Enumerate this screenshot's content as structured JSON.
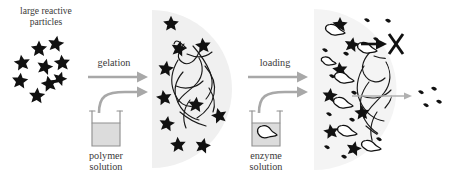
{
  "figure": {
    "type": "schematic-diagram",
    "background": "#ffffff",
    "width": 452,
    "height": 179
  },
  "colors": {
    "particle_black": "#111111",
    "gel_gray": "#f0f0f0",
    "arrow_gray": "#a8a8a8",
    "beaker_fill": "#dcdcdc",
    "beaker_outline": "#9a9a9a",
    "text": "#3a3a3a",
    "enzyme_white": "#ffffff"
  },
  "labels": {
    "particles_title": "large reactive\nparticles",
    "step1": "gelation",
    "step1_source": "polymer\nsolution",
    "step2": "loading",
    "step2_source": "enzyme\nsolution"
  },
  "panels": [
    {
      "id": "panel-particles",
      "name": "large-reactive-particles",
      "title": "large reactive\nparticles",
      "star_count": 9,
      "stars": [
        {
          "x": 39,
          "y": 48,
          "r": 7.4,
          "rot": 0
        },
        {
          "x": 56,
          "y": 43,
          "r": 7.4,
          "rot": 10
        },
        {
          "x": 22,
          "y": 62,
          "r": 7.4,
          "rot": -8
        },
        {
          "x": 45,
          "y": 66,
          "r": 7.4,
          "rot": 14
        },
        {
          "x": 62,
          "y": 62,
          "r": 7.4,
          "rot": -5
        },
        {
          "x": 20,
          "y": 80,
          "r": 7.4,
          "rot": 6
        },
        {
          "x": 49,
          "y": 83,
          "r": 7.4,
          "rot": -12
        },
        {
          "x": 37,
          "y": 95,
          "r": 7.4,
          "rot": 4
        },
        {
          "x": 60,
          "y": 78,
          "r": 6.6,
          "rot": 18
        }
      ]
    },
    {
      "id": "panel-hydrogel",
      "name": "hydrogel-with-particles",
      "star_count": 10,
      "has_polymer_network": true,
      "stars": [
        {
          "x": 171,
          "y": 23,
          "r": 7.2,
          "rot": 0
        },
        {
          "x": 179,
          "y": 48,
          "r": 7.2,
          "rot": 12
        },
        {
          "x": 203,
          "y": 45,
          "r": 7.2,
          "rot": -6
        },
        {
          "x": 166,
          "y": 68,
          "r": 7.2,
          "rot": 8
        },
        {
          "x": 164,
          "y": 97,
          "r": 7.2,
          "rot": -10
        },
        {
          "x": 196,
          "y": 104,
          "r": 7.2,
          "rot": 5
        },
        {
          "x": 219,
          "y": 115,
          "r": 7.2,
          "rot": -14
        },
        {
          "x": 167,
          "y": 123,
          "r": 7.2,
          "rot": 9
        },
        {
          "x": 178,
          "y": 144,
          "r": 7.2,
          "rot": -4
        },
        {
          "x": 203,
          "y": 145,
          "r": 7.2,
          "rot": 13
        }
      ]
    },
    {
      "id": "panel-loaded",
      "name": "enzyme-loaded-hydrogel",
      "star_count": 7,
      "enzyme_count": 9,
      "fragment_count": 12,
      "escaped_fragment_count": 4,
      "blocked_marker": "X",
      "has_polymer_network": true
    }
  ],
  "transitions": [
    {
      "id": "transition-gelation",
      "name": "gelation",
      "label": "gelation",
      "source_label": "polymer\nsolution",
      "source_vessel": "beaker",
      "vessel_contents": "polymer solution",
      "arrow_color": "#a8a8a8"
    },
    {
      "id": "transition-loading",
      "name": "loading",
      "label": "loading",
      "source_label": "enzyme\nsolution",
      "source_vessel": "beaker",
      "vessel_contents": "enzyme",
      "arrow_color": "#a8a8a8"
    }
  ],
  "annotations": {
    "blocked_escape": {
      "marker": "X",
      "meaning": "enzyme cannot escape",
      "arrow_color": "#111111"
    },
    "product_release": {
      "meaning": "degradation products escape",
      "arrow_color": "#b0b0b0"
    }
  }
}
